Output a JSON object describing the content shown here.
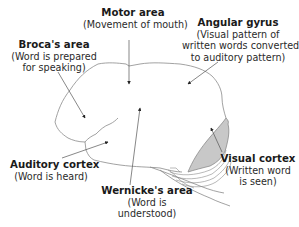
{
  "diagram": {
    "type": "brain-language-areas",
    "colors": {
      "outline": "#8a8a8a",
      "visual_cortex_fill": "#c8c8c8",
      "arrow": "#333333",
      "text": "#1a1a1a"
    },
    "labels": [
      {
        "id": "motor",
        "title": "Motor area",
        "desc": [
          "(Movement of mouth)"
        ]
      },
      {
        "id": "broca",
        "title": "Broca's area",
        "desc": [
          "(Word is prepared",
          "for speaking)"
        ]
      },
      {
        "id": "angular",
        "title": "Angular gyrus",
        "desc": [
          "(Visual pattern of",
          "written words converted",
          "to auditory pattern)"
        ]
      },
      {
        "id": "auditory",
        "title": "Auditory cortex",
        "desc": [
          "(Word is heard)"
        ]
      },
      {
        "id": "wernicke",
        "title": "Wernicke's area",
        "desc": [
          "(Word is",
          "understood)"
        ]
      },
      {
        "id": "visual",
        "title": "Visual cortex",
        "desc": [
          "(Written word",
          "is seen)"
        ]
      }
    ]
  }
}
